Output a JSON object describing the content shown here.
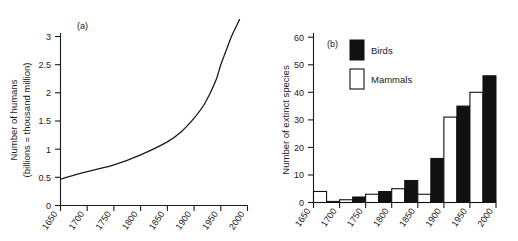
{
  "figure": {
    "background_color": "#ffffff",
    "ink_color": "#1a1a1a",
    "width": 518,
    "height": 241
  },
  "chart_data": [
    {
      "id": "panel-a",
      "type": "line",
      "panel_letter": "(a)",
      "title": "",
      "xlabel": "",
      "ylabel": "Number of humans\n(billions = thousand million)",
      "ylabel_line1": "Number of humans",
      "ylabel_line2": "(billions = thousand million)",
      "xlim": [
        1650,
        2000
      ],
      "ylim": [
        0,
        3.35
      ],
      "grid": false,
      "legend": "none",
      "xticks": [
        1650,
        1700,
        1750,
        1800,
        1850,
        1900,
        1950,
        2000
      ],
      "xticklabels": [
        "1650",
        "1700",
        "1750",
        "1800",
        "1850",
        "1900",
        "1950",
        "2000"
      ],
      "yticks": [
        0,
        0.5,
        1,
        1.5,
        2,
        2.5,
        3
      ],
      "yticklabels": [
        "0",
        "0.5",
        "1",
        "1.5",
        "2",
        "2.5",
        "3"
      ],
      "series": [
        {
          "name": "World human population",
          "x": [
            1650,
            1700,
            1750,
            1800,
            1850,
            1875,
            1900,
            1920,
            1940,
            1950,
            1960,
            1970,
            1980,
            1985
          ],
          "y": [
            0.47,
            0.6,
            0.72,
            0.9,
            1.13,
            1.3,
            1.55,
            1.81,
            2.2,
            2.5,
            2.75,
            3.0,
            3.2,
            3.3
          ]
        }
      ]
    },
    {
      "id": "panel-b",
      "type": "bar",
      "panel_letter": "(b)",
      "title": "",
      "xlabel": "",
      "ylabel": "Number of extinct species",
      "xlim": [
        1650,
        2000
      ],
      "ylim": [
        0,
        60
      ],
      "grid": false,
      "legend": "inside-top-left",
      "legend_entries": [
        {
          "label": "Birds",
          "color": "#111111",
          "style": "filled"
        },
        {
          "label": "Mammals",
          "color": "#ffffff",
          "style": "outlined"
        }
      ],
      "xticks": [
        1650,
        1700,
        1750,
        1800,
        1850,
        1900,
        1950,
        2000
      ],
      "xticklabels": [
        "1650",
        "1700",
        "1750",
        "1800",
        "1850",
        "1900",
        "1950",
        "2000"
      ],
      "yticks": [
        0,
        10,
        20,
        30,
        40,
        50,
        60
      ],
      "yticklabels": [
        "0",
        "10",
        "20",
        "30",
        "40",
        "50",
        "60"
      ],
      "categories": [
        "1650-1700",
        "1700-1750",
        "1750-1800",
        "1800-1850",
        "1850-1900",
        "1900-1950",
        "1950-2000"
      ],
      "series": [
        {
          "name": "Mammals",
          "color": "#ffffff",
          "values": [
            4,
            1,
            3,
            5,
            3,
            31,
            40
          ]
        },
        {
          "name": "Birds",
          "color": "#111111",
          "values": [
            0.4,
            2,
            4,
            8,
            16,
            35,
            46
          ]
        }
      ]
    }
  ]
}
